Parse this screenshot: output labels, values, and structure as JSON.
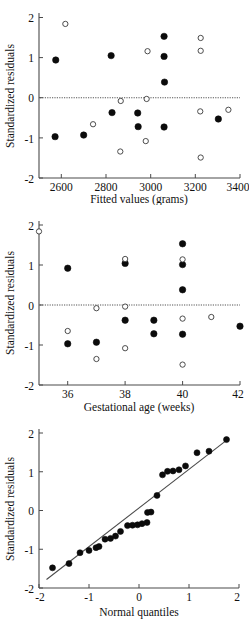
{
  "figure": {
    "background_color": "#ffffff",
    "point_filled_color": "#0b0b0b",
    "point_open_color": "#ffffff",
    "axis_color": "#4a4a4a",
    "shared_ylabel": "Standardized residuals"
  },
  "chart_data": [
    {
      "id": "fitted-values-residuals",
      "type": "scatter",
      "title": "",
      "xlabel": "Fitted values (grams)",
      "ylabel": "Standardized residuals",
      "xlim": [
        2500,
        3400
      ],
      "ylim": [
        -2,
        2
      ],
      "xticks": [
        2600,
        2800,
        3000,
        3200,
        3400
      ],
      "xticklabels": [
        "2600",
        "2800",
        "3000",
        "3200",
        "3400"
      ],
      "yticks": [
        -2,
        -1,
        0,
        1,
        2
      ],
      "yticklabels": [
        "-2",
        "-1",
        "0",
        "1",
        "2"
      ],
      "grid": false,
      "legend": "none",
      "annotations": [
        {
          "kind": "hline",
          "y": 0,
          "style": "dotted",
          "label": "zero residual reference line"
        }
      ],
      "series": [
        {
          "name": "Filled markers",
          "marker": "filled-circle",
          "points": [
            {
              "x": 2575,
              "y": 0.94
            },
            {
              "x": 2572,
              "y": -0.97
            },
            {
              "x": 2700,
              "y": -0.93
            },
            {
              "x": 2823,
              "y": 1.05
            },
            {
              "x": 2827,
              "y": -0.37
            },
            {
              "x": 2942,
              "y": -0.38
            },
            {
              "x": 2944,
              "y": -0.72
            },
            {
              "x": 3060,
              "y": 1.53
            },
            {
              "x": 3060,
              "y": 1.03
            },
            {
              "x": 3062,
              "y": 0.39
            },
            {
              "x": 3060,
              "y": -0.73
            },
            {
              "x": 3303,
              "y": -0.53
            }
          ]
        },
        {
          "name": "Open markers",
          "marker": "open-circle",
          "points": [
            {
              "x": 2618,
              "y": 1.84
            },
            {
              "x": 2742,
              "y": -0.66
            },
            {
              "x": 2866,
              "y": -0.08
            },
            {
              "x": 2864,
              "y": -1.34
            },
            {
              "x": 2986,
              "y": 1.16
            },
            {
              "x": 2982,
              "y": -0.03
            },
            {
              "x": 2978,
              "y": -1.08
            },
            {
              "x": 3224,
              "y": 1.49
            },
            {
              "x": 3224,
              "y": 1.17
            },
            {
              "x": 3222,
              "y": -0.34
            },
            {
              "x": 3224,
              "y": -1.49
            },
            {
              "x": 3348,
              "y": -0.3
            }
          ]
        }
      ]
    },
    {
      "id": "gestational-age-residuals",
      "type": "scatter",
      "title": "",
      "xlabel": "Gestational age (weeks)",
      "ylabel": "Standardized residuals",
      "xlim": [
        35,
        42
      ],
      "ylim": [
        -2,
        2
      ],
      "xticks": [
        36,
        38,
        40,
        42
      ],
      "xticklabels": [
        "36",
        "38",
        "40",
        "42"
      ],
      "yticks": [
        -2,
        -1,
        0,
        1,
        2
      ],
      "yticklabels": [
        "-2",
        "-1",
        "0",
        "1",
        "2"
      ],
      "grid": false,
      "legend": "none",
      "annotations": [
        {
          "kind": "hline",
          "y": 0,
          "style": "dotted",
          "label": "zero residual reference line"
        }
      ],
      "series": [
        {
          "name": "Filled markers",
          "marker": "filled-circle",
          "points": [
            {
              "x": 36.0,
              "y": 0.92
            },
            {
              "x": 36.0,
              "y": -0.97
            },
            {
              "x": 37.0,
              "y": -0.93
            },
            {
              "x": 38.0,
              "y": 1.04
            },
            {
              "x": 38.0,
              "y": -0.38
            },
            {
              "x": 39.0,
              "y": -0.38
            },
            {
              "x": 39.0,
              "y": -0.72
            },
            {
              "x": 40.0,
              "y": 1.53
            },
            {
              "x": 40.0,
              "y": 1.01
            },
            {
              "x": 40.0,
              "y": 0.38
            },
            {
              "x": 40.0,
              "y": -0.73
            },
            {
              "x": 42.0,
              "y": -0.53
            }
          ]
        },
        {
          "name": "Open markers",
          "marker": "open-circle",
          "points": [
            {
              "x": 35.0,
              "y": 1.84
            },
            {
              "x": 36.0,
              "y": -0.65
            },
            {
              "x": 37.0,
              "y": -0.08
            },
            {
              "x": 37.0,
              "y": -1.35
            },
            {
              "x": 38.0,
              "y": 1.15
            },
            {
              "x": 38.0,
              "y": -0.04
            },
            {
              "x": 38.0,
              "y": -1.08
            },
            {
              "x": 40.0,
              "y": 1.14
            },
            {
              "x": 40.0,
              "y": -0.34
            },
            {
              "x": 40.0,
              "y": -1.49
            },
            {
              "x": 41.0,
              "y": -0.3
            }
          ]
        }
      ]
    },
    {
      "id": "normal-qq-plot",
      "type": "scatter",
      "title": "",
      "xlabel": "Normal quantiles",
      "ylabel": "Standardized residuals",
      "xlim": [
        -2,
        2
      ],
      "ylim": [
        -2,
        2
      ],
      "xticks": [
        -2,
        -1,
        0,
        1,
        2
      ],
      "xticklabels": [
        "-2",
        "-1",
        "0",
        "1",
        "2"
      ],
      "yticks": [
        -2,
        -1,
        0,
        1,
        2
      ],
      "yticklabels": [
        "-2",
        "-1",
        "0",
        "1",
        "2"
      ],
      "grid": false,
      "legend": "none",
      "annotations": [
        {
          "kind": "reference-line",
          "x0": -1.85,
          "y0": -1.78,
          "x1": 1.8,
          "y1": 1.86,
          "label": "normality reference line"
        }
      ],
      "series": [
        {
          "name": "Filled markers",
          "marker": "filled-circle",
          "points": [
            {
              "x": -1.73,
              "y": -1.48
            },
            {
              "x": -1.4,
              "y": -1.37
            },
            {
              "x": -1.18,
              "y": -1.09
            },
            {
              "x": -1.0,
              "y": -1.03
            },
            {
              "x": -0.86,
              "y": -0.96
            },
            {
              "x": -0.8,
              "y": -0.93
            },
            {
              "x": -0.68,
              "y": -0.74
            },
            {
              "x": -0.57,
              "y": -0.72
            },
            {
              "x": -0.47,
              "y": -0.66
            },
            {
              "x": -0.37,
              "y": -0.54
            },
            {
              "x": -0.23,
              "y": -0.39
            },
            {
              "x": -0.13,
              "y": -0.38
            },
            {
              "x": -0.03,
              "y": -0.37
            },
            {
              "x": 0.06,
              "y": -0.34
            },
            {
              "x": 0.16,
              "y": -0.31
            },
            {
              "x": 0.17,
              "y": -0.05
            },
            {
              "x": 0.24,
              "y": -0.04
            },
            {
              "x": 0.36,
              "y": 0.39
            },
            {
              "x": 0.47,
              "y": 0.92
            },
            {
              "x": 0.57,
              "y": 1.01
            },
            {
              "x": 0.68,
              "y": 1.02
            },
            {
              "x": 0.8,
              "y": 1.05
            },
            {
              "x": 0.93,
              "y": 1.15
            },
            {
              "x": 1.16,
              "y": 1.49
            },
            {
              "x": 1.4,
              "y": 1.53
            },
            {
              "x": 1.75,
              "y": 1.83
            }
          ]
        }
      ]
    }
  ]
}
